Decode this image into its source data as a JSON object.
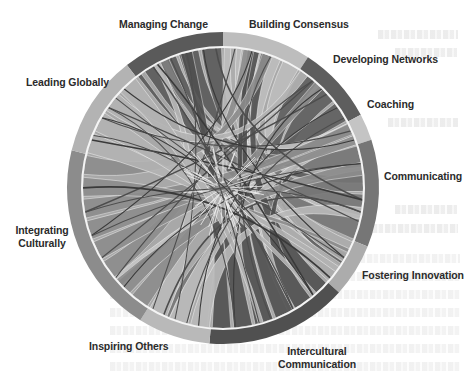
{
  "diagram": {
    "type": "chord",
    "center": [
      223,
      188
    ],
    "outer_radius": 156,
    "inner_radius": 141,
    "segments": [
      {
        "id": "managing-change",
        "label": "Managing Change",
        "start": -38,
        "end": 0,
        "color": "#5a5a5a"
      },
      {
        "id": "building-consensus",
        "label": "Building Consensus",
        "start": 0,
        "end": 33,
        "color": "#bdbdbd"
      },
      {
        "id": "developing-networks",
        "label": "Developing Networks",
        "start": 33,
        "end": 62,
        "color": "#5e5e5e"
      },
      {
        "id": "coaching",
        "label": "Coaching",
        "start": 62,
        "end": 72,
        "color": "#c4c4c4"
      },
      {
        "id": "communicating",
        "label": "Communicating",
        "start": 72,
        "end": 112,
        "color": "#767676"
      },
      {
        "id": "fostering-innovation",
        "label": "Fostering Innovation",
        "start": 112,
        "end": 132,
        "color": "#acacac"
      },
      {
        "id": "intercultural-communication",
        "label": "Intercultural\nCommunication",
        "start": 132,
        "end": 185,
        "color": "#505050"
      },
      {
        "id": "inspiring-others",
        "label": "Inspiring Others",
        "start": 185,
        "end": 212,
        "color": "#b9b9b9"
      },
      {
        "id": "integrating-culturally",
        "label": "Integrating\nCulturally",
        "start": 212,
        "end": 284,
        "color": "#8c8c8c"
      },
      {
        "id": "leading-globally",
        "label": "Leading Globally",
        "start": 284,
        "end": 322,
        "color": "#b3b3b3"
      }
    ]
  },
  "labels": {
    "managing_change": "Managing Change",
    "building_consensus": "Building Consensus",
    "developing_networks": "Developing Networks",
    "coaching": "Coaching",
    "communicating": "Communicating",
    "fostering_innovation": "Fostering Innovation",
    "intercultural_line1": "Intercultural",
    "intercultural_line2": "Communication",
    "inspiring_others": "Inspiring Others",
    "integrating_line1": "Integrating",
    "integrating_line2": "Culturally",
    "leading_globally": "Leading Globally"
  },
  "colors": {
    "background": "#ffffff",
    "inner_border": "#f2f2f2",
    "label_text": "#2b2b2b",
    "dark_line": "#3a3a3a"
  }
}
